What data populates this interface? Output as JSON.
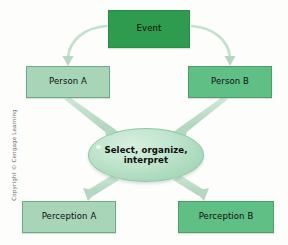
{
  "diagram": {
    "nodes": {
      "event": {
        "label": "Event",
        "shape": "rectangle",
        "fill": "#2e9b4e"
      },
      "person_a": {
        "label": "Person A",
        "shape": "rectangle",
        "fill": "#a8d5b8"
      },
      "person_b": {
        "label": "Person B",
        "shape": "rectangle",
        "fill": "#5fbf85"
      },
      "process": {
        "label": "Select, organize, interpret",
        "shape": "ellipse",
        "fill": "#bfe4cc"
      },
      "perception_a": {
        "label": "Perception A",
        "shape": "rectangle",
        "fill": "#a8d5b8"
      },
      "perception_b": {
        "label": "Perception B",
        "shape": "rectangle",
        "fill": "#5fbf85"
      }
    },
    "arrows": [
      {
        "name": "event-to-person-a",
        "from": "event",
        "to": "person_a",
        "style": "curved"
      },
      {
        "name": "event-to-person-b",
        "from": "event",
        "to": "person_b",
        "style": "curved"
      },
      {
        "name": "person-a-to-process",
        "from": "person_a",
        "to": "process",
        "style": "straight"
      },
      {
        "name": "person-b-to-process",
        "from": "person_b",
        "to": "process",
        "style": "straight"
      },
      {
        "name": "process-to-perception-a",
        "from": "process",
        "to": "perception_a",
        "style": "straight"
      },
      {
        "name": "process-to-perception-b",
        "from": "process",
        "to": "perception_b",
        "style": "straight"
      }
    ],
    "arrow_color": "#b5d8c0",
    "credit": "Copyright © Cengage Learning"
  }
}
